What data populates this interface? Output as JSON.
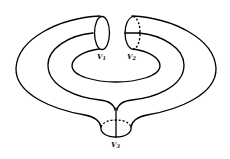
{
  "diagram": {
    "boundaries": [
      {
        "id": "v1",
        "label": "V",
        "subscript": "1"
      },
      {
        "id": "v2",
        "label": "V",
        "subscript": "2"
      },
      {
        "id": "v3",
        "label": "V",
        "subscript": "3"
      }
    ],
    "line_color": "#000000",
    "background": "#ffffff"
  }
}
